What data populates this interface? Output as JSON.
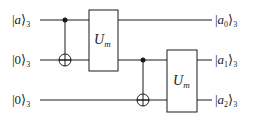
{
  "diagram": {
    "type": "quantum-circuit",
    "inputs": [
      {
        "ket": "a",
        "subscript": "3"
      },
      {
        "ket": "0",
        "subscript": "3"
      },
      {
        "ket": "0",
        "subscript": "3"
      }
    ],
    "outputs": [
      {
        "ket": "a",
        "ket_sub": "0",
        "subscript": "3"
      },
      {
        "ket": "a",
        "ket_sub": "1",
        "subscript": "3"
      },
      {
        "ket": "a",
        "ket_sub": "2",
        "subscript": "3"
      }
    ],
    "gates": [
      {
        "type": "CNOT",
        "control_wire": 0,
        "target_wire": 1
      },
      {
        "type": "U",
        "label": "U",
        "label_sub": "m",
        "wires": [
          0,
          1
        ]
      },
      {
        "type": "CNOT",
        "control_wire": 1,
        "target_wire": 2
      },
      {
        "type": "U",
        "label": "U",
        "label_sub": "m",
        "wires": [
          1,
          2
        ]
      }
    ],
    "colors": {
      "line": "#1a1a1a",
      "background": "#ffffff"
    }
  }
}
